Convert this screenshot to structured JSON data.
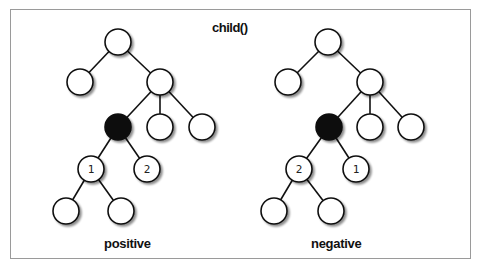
{
  "title": "child()",
  "panels": [
    {
      "label": "positive",
      "numbered_children": [
        "1",
        "2"
      ]
    },
    {
      "label": "negative",
      "numbered_children": [
        "2",
        "1"
      ]
    }
  ],
  "colors": {
    "node_fill": "#ffffff",
    "node_stroke": "#111111",
    "selected_node": "#111111",
    "border": "#9a9a9a"
  }
}
